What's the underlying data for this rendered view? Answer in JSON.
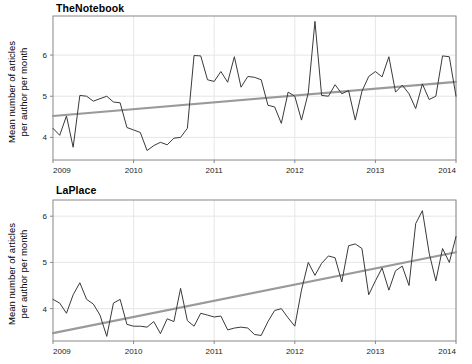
{
  "figure": {
    "width": 472,
    "height": 364,
    "background": "#ffffff",
    "series_color": "#3a3a3a",
    "trend_color": "#9a9a9a",
    "grid_color": "#e6e6e6",
    "frame_color": "#888888"
  },
  "chart_data": [
    {
      "type": "line",
      "title": "TheNotebook",
      "xlabel": "",
      "ylabel": "Mean number of articles\nper author per month",
      "xlim": [
        2009.0,
        2014.0
      ],
      "ylim": [
        3.45,
        6.95
      ],
      "xticks": [
        2009,
        2010,
        2011,
        2012,
        2013,
        2014
      ],
      "xtick_labels": [
        "2009",
        "2010",
        "2011",
        "2012",
        "2013",
        "2014"
      ],
      "yticks": [
        4,
        5,
        6
      ],
      "ytick_labels": [
        "4",
        "5",
        "6"
      ],
      "grid": true,
      "legend": "none",
      "series": [
        {
          "name": "Mean articles per author per month",
          "style": "solid",
          "color": "#3a3a3a",
          "x": [
            2009.0,
            2009.083,
            2009.167,
            2009.25,
            2009.333,
            2009.417,
            2009.5,
            2009.583,
            2009.667,
            2009.75,
            2009.833,
            2009.917,
            2010.0,
            2010.083,
            2010.167,
            2010.25,
            2010.333,
            2010.417,
            2010.5,
            2010.583,
            2010.667,
            2010.75,
            2010.833,
            2010.917,
            2011.0,
            2011.083,
            2011.167,
            2011.25,
            2011.333,
            2011.417,
            2011.5,
            2011.583,
            2011.667,
            2011.75,
            2011.833,
            2011.917,
            2012.0,
            2012.083,
            2012.167,
            2012.25,
            2012.333,
            2012.417,
            2012.5,
            2012.583,
            2012.667,
            2012.75,
            2012.833,
            2012.917,
            2013.0,
            2013.083,
            2013.167,
            2013.25,
            2013.333,
            2013.417,
            2013.5,
            2013.583,
            2013.667,
            2013.75,
            2013.833,
            2013.917,
            2014.0
          ],
          "values": [
            4.22,
            4.05,
            4.52,
            3.76,
            5.02,
            5.0,
            4.88,
            4.94,
            5.0,
            4.86,
            4.84,
            4.24,
            4.18,
            4.12,
            3.68,
            3.8,
            3.88,
            3.82,
            3.98,
            4.0,
            4.22,
            5.99,
            5.98,
            5.4,
            5.36,
            5.6,
            5.34,
            5.96,
            5.22,
            5.48,
            5.46,
            5.4,
            4.78,
            4.74,
            4.34,
            5.1,
            5.0,
            4.42,
            5.08,
            6.82,
            5.02,
            5.0,
            5.28,
            5.06,
            5.14,
            4.42,
            5.12,
            5.48,
            5.6,
            5.47,
            5.96,
            5.1,
            5.27,
            5.06,
            4.7,
            5.3,
            4.92,
            5.0,
            5.98,
            5.96,
            5.0
          ],
          "extra_values": [
            4.68,
            4.68,
            4.99
          ]
        }
      ],
      "trend": {
        "name": "Linear trend",
        "color": "#9a9a9a",
        "x": [
          2009.0,
          2014.0
        ],
        "y": [
          4.52,
          5.35
        ]
      }
    },
    {
      "type": "line",
      "title": "LaPlace",
      "xlabel": "",
      "ylabel": "Mean number of articles\nper author per month",
      "xlim": [
        2009.0,
        2014.0
      ],
      "ylim": [
        3.3,
        6.35
      ],
      "xticks": [
        2009,
        2010,
        2011,
        2012,
        2013,
        2014
      ],
      "xtick_labels": [
        "2009",
        "2010",
        "2011",
        "2012",
        "2013",
        "2014"
      ],
      "yticks": [
        4,
        5,
        6
      ],
      "ytick_labels": [
        "4",
        "5",
        "6"
      ],
      "grid": true,
      "legend": "none",
      "series": [
        {
          "name": "Mean articles per author per month",
          "style": "solid",
          "color": "#3a3a3a",
          "x": [
            2009.0,
            2009.083,
            2009.167,
            2009.25,
            2009.333,
            2009.417,
            2009.5,
            2009.583,
            2009.667,
            2009.75,
            2009.833,
            2009.917,
            2010.0,
            2010.083,
            2010.167,
            2010.25,
            2010.333,
            2010.417,
            2010.5,
            2010.583,
            2010.667,
            2010.75,
            2010.833,
            2010.917,
            2011.0,
            2011.083,
            2011.167,
            2011.25,
            2011.333,
            2011.417,
            2011.5,
            2011.583,
            2011.667,
            2011.75,
            2011.833,
            2011.917,
            2012.0,
            2012.083,
            2012.167,
            2012.25,
            2012.333,
            2012.417,
            2012.5,
            2012.583,
            2012.667,
            2012.75,
            2012.833,
            2012.917,
            2013.0,
            2013.083,
            2013.167,
            2013.25,
            2013.333,
            2013.417,
            2013.5,
            2013.583,
            2013.667,
            2013.75,
            2013.833,
            2013.917,
            2014.0
          ],
          "values": [
            4.2,
            4.12,
            3.9,
            4.3,
            4.56,
            4.2,
            4.1,
            3.86,
            3.4,
            4.12,
            4.2,
            3.66,
            3.62,
            3.62,
            3.6,
            3.72,
            3.46,
            3.78,
            3.72,
            4.44,
            3.74,
            3.62,
            3.9,
            3.86,
            3.82,
            3.84,
            3.54,
            3.58,
            3.6,
            3.58,
            3.44,
            3.42,
            3.72,
            3.96,
            4.0,
            3.8,
            3.62,
            4.4,
            5.0,
            4.72,
            4.98,
            5.14,
            5.1,
            4.58,
            5.36,
            5.4,
            5.3,
            4.3,
            4.6,
            4.88,
            4.4,
            4.82,
            4.92,
            4.5,
            5.84,
            6.12,
            5.2,
            4.6,
            5.3,
            5.0,
            5.56
          ],
          "extra_values": [
            5.2,
            5.4,
            4.36,
            5.55
          ]
        }
      ],
      "trend": {
        "name": "Linear trend",
        "color": "#9a9a9a",
        "x": [
          2009.0,
          2014.0
        ],
        "y": [
          3.47,
          5.22
        ]
      }
    }
  ]
}
